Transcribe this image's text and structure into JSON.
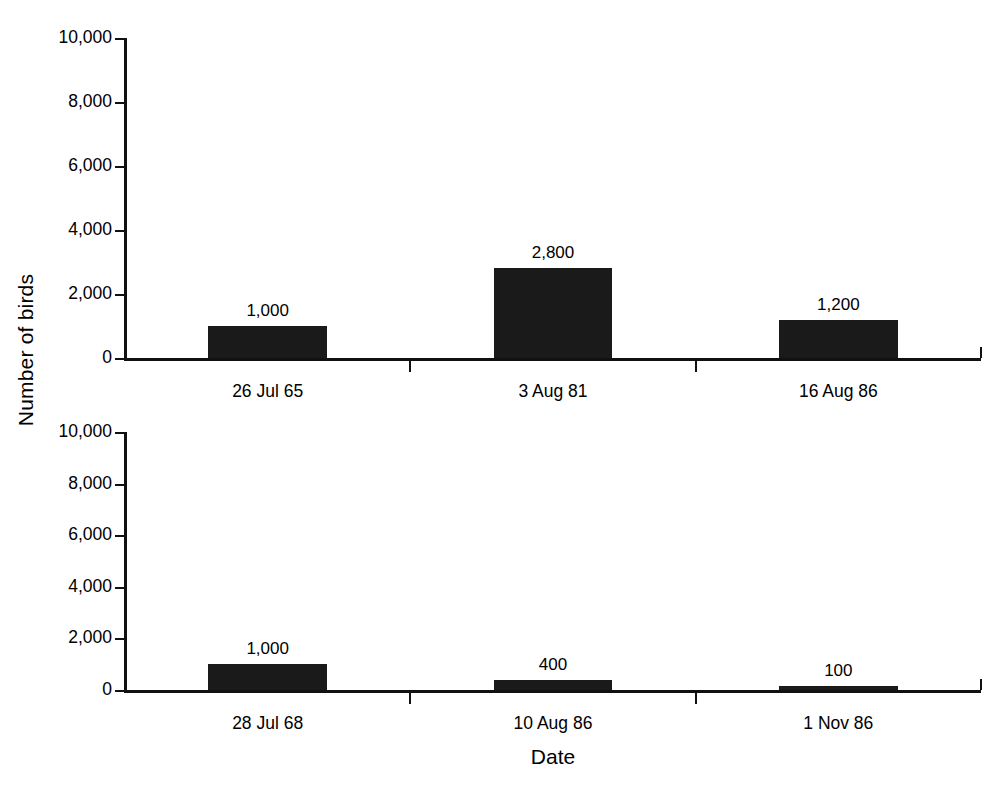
{
  "chart_data": [
    {
      "type": "bar",
      "panel": "top",
      "categories": [
        "26 Jul 65",
        "3 Aug 81",
        "16 Aug 86"
      ],
      "values": [
        1000,
        2800,
        1200
      ],
      "value_labels": [
        "1,000",
        "2,800",
        "1,200"
      ],
      "title": "",
      "xlabel": "",
      "ylabel": "Number of birds",
      "ylim": [
        0,
        10000
      ],
      "yticks": [
        0,
        2000,
        4000,
        6000,
        8000,
        10000
      ],
      "ytick_labels": [
        "0",
        "2,000",
        "4,000",
        "6,000",
        "8,000",
        "10,000"
      ],
      "grid": false,
      "legend": false,
      "bar_color": "#1a1a1a"
    },
    {
      "type": "bar",
      "panel": "bottom",
      "categories": [
        "28 Jul 68",
        "10 Aug 86",
        "1 Nov 86"
      ],
      "values": [
        1000,
        400,
        100
      ],
      "value_labels": [
        "1,000",
        "400",
        "100"
      ],
      "title": "",
      "xlabel": "Date",
      "ylabel": "Number of birds",
      "ylim": [
        0,
        10000
      ],
      "yticks": [
        0,
        2000,
        4000,
        6000,
        8000,
        10000
      ],
      "ytick_labels": [
        "0",
        "2,000",
        "4,000",
        "6,000",
        "8,000",
        "10,000"
      ],
      "grid": false,
      "legend": false,
      "bar_color": "#1a1a1a"
    }
  ],
  "axis_titles": {
    "y": "Number of birds",
    "x": "Date"
  }
}
